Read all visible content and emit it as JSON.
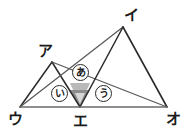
{
  "figure": {
    "kind": "geometry-diagram",
    "title": "",
    "canvas": {
      "width": 189,
      "height": 136,
      "background": "#ffffff"
    },
    "colors": {
      "stroke_dark": "#1f1f1f",
      "stroke_mid": "#555555",
      "baseline": "#6b6b6b",
      "shade_dark": "#8d8d8d",
      "shade_light": "#b9b9b9",
      "label_text": "#1b1b1b",
      "circle_outline": "#2a2a2a"
    },
    "points": [
      {
        "id": "A",
        "label": "ア",
        "x": 52,
        "y": 62,
        "label_x": 38,
        "label_y": 44,
        "size": "big"
      },
      {
        "id": "I",
        "label": "イ",
        "x": 123,
        "y": 27,
        "label_x": 124,
        "label_y": 8,
        "size": "big"
      },
      {
        "id": "U",
        "label": "ウ",
        "x": 20,
        "y": 107,
        "label_x": 8,
        "label_y": 112,
        "size": "big"
      },
      {
        "id": "E",
        "label": "エ",
        "x": 80,
        "y": 107,
        "label_x": 73,
        "label_y": 114,
        "size": "big"
      },
      {
        "id": "O",
        "label": "オ",
        "x": 167,
        "y": 107,
        "label_x": 166,
        "label_y": 112,
        "size": "big"
      }
    ],
    "segments": [
      {
        "name": "u-a",
        "from": "U",
        "to": "A",
        "color": "#2b2b2b",
        "width": 1.5
      },
      {
        "name": "a-e",
        "from": "A",
        "to": "E",
        "color": "#2b2b2b",
        "width": 1.5
      },
      {
        "name": "u-i",
        "from": "U",
        "to": "I",
        "color": "#5a5a5a",
        "width": 1.3
      },
      {
        "name": "a-o",
        "from": "A",
        "to": "O",
        "color": "#5a5a5a",
        "width": 1.3
      },
      {
        "name": "i-e",
        "from": "I",
        "to": "E",
        "color": "#2b2b2b",
        "width": 1.5
      },
      {
        "name": "i-o",
        "from": "I",
        "to": "O",
        "color": "#2b2b2b",
        "width": 1.6
      },
      {
        "name": "u-o-baseline",
        "from": "U",
        "to": "O",
        "color": "#6b6b6b",
        "width": 1.6
      }
    ],
    "shaded_regions": [
      {
        "name": "upper-cap",
        "color": "#b9b9b9",
        "points": "70,83 90,83 86,92 74,92"
      },
      {
        "name": "lower-wedge",
        "color": "#8d8d8d",
        "points": "70,90 90,90 80,107"
      },
      {
        "name": "inner-notch",
        "color": "#d6d6d6",
        "points": "75,93 85,93 80,104"
      }
    ],
    "angle_labels": [
      {
        "id": "a1",
        "label": "あ",
        "x": 72,
        "y": 64
      },
      {
        "id": "a2",
        "label": "い",
        "x": 51,
        "y": 85
      },
      {
        "id": "a3",
        "label": "う",
        "x": 95,
        "y": 85
      }
    ]
  }
}
